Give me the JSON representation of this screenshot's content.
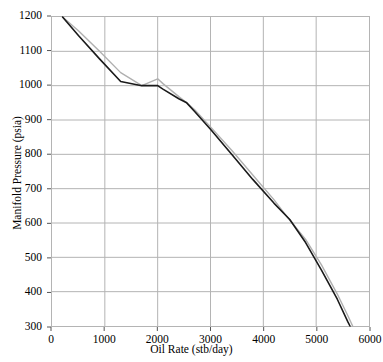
{
  "chart_data": {
    "type": "line",
    "title": "",
    "xlabel": "Oil Rate (stb/day)",
    "ylabel": "Manifold Pressure (psia)",
    "xlim": [
      0,
      6000
    ],
    "ylim": [
      300,
      1200
    ],
    "xticks": [
      0,
      1000,
      2000,
      3000,
      4000,
      5000,
      6000
    ],
    "yticks": [
      300,
      400,
      500,
      600,
      700,
      800,
      900,
      1000,
      1100,
      1200
    ],
    "grid": true,
    "legend": "none",
    "series": [
      {
        "name": "black-curve",
        "color": "#1a1a1a",
        "width": 1.6,
        "points": [
          [
            200,
            1200
          ],
          [
            500,
            1146
          ],
          [
            900,
            1078
          ],
          [
            1300,
            1012
          ],
          [
            1700,
            1000
          ],
          [
            2000,
            1000
          ],
          [
            2100,
            990
          ],
          [
            2400,
            962
          ],
          [
            2550,
            950
          ],
          [
            2700,
            925
          ],
          [
            3000,
            873
          ],
          [
            3400,
            800
          ],
          [
            3800,
            727
          ],
          [
            4200,
            658
          ],
          [
            4500,
            610
          ],
          [
            4800,
            543
          ],
          [
            5100,
            463
          ],
          [
            5400,
            378
          ],
          [
            5600,
            312
          ],
          [
            5640,
            300
          ]
        ]
      },
      {
        "name": "gray-curve",
        "color": "#b0b0b0",
        "width": 1.4,
        "points": [
          [
            200,
            1200
          ],
          [
            500,
            1160
          ],
          [
            900,
            1100
          ],
          [
            1300,
            1038
          ],
          [
            1700,
            1000
          ],
          [
            2000,
            1020
          ],
          [
            2100,
            1006
          ],
          [
            2400,
            968
          ],
          [
            2550,
            950
          ],
          [
            2700,
            930
          ],
          [
            3000,
            880
          ],
          [
            3400,
            812
          ],
          [
            3800,
            740
          ],
          [
            4200,
            668
          ],
          [
            4450,
            618
          ],
          [
            4800,
            552
          ],
          [
            5100,
            478
          ],
          [
            5400,
            393
          ],
          [
            5600,
            330
          ],
          [
            5690,
            300
          ]
        ]
      }
    ]
  },
  "axes": {
    "x_tick_labels": [
      "0",
      "1000",
      "2000",
      "3000",
      "4000",
      "5000",
      "6000"
    ],
    "y_tick_labels": [
      "300",
      "400",
      "500",
      "600",
      "700",
      "800",
      "900",
      "1000",
      "1100",
      "1200"
    ],
    "x_title": "Oil Rate (stb/day)",
    "y_title": "Manifold Pressure (psia)"
  },
  "style": {
    "grid_color": "#b4b4b4",
    "border_color": "#b4b4b4",
    "background": "#ffffff",
    "tick_color": "#555555"
  }
}
